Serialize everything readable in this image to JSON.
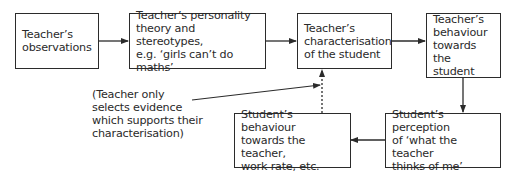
{
  "diagram": {
    "type": "flowchart",
    "nodes": [
      {
        "id": "n1",
        "label": "Teacher’s\nobservations"
      },
      {
        "id": "n2",
        "label": "Teacher’s personality\ntheory and stereotypes,\ne.g. ‘girls can’t do maths’"
      },
      {
        "id": "n3",
        "label": "Teacher’s\ncharacterisation\nof the student"
      },
      {
        "id": "n4",
        "label": "Teacher’s\nbehaviour\ntowards the\nstudent"
      },
      {
        "id": "n5",
        "label": "Student’s perception\nof ‘what the teacher\nthinks of me’"
      },
      {
        "id": "n6",
        "label": "Student’s behaviour\ntowards the teacher,\nwork rate, etc."
      }
    ],
    "annotation": {
      "label": "(Teacher only\n selects evidence\n which supports their\n characterisation)"
    },
    "edges": [
      {
        "from": "n1",
        "to": "n2",
        "style": "solid"
      },
      {
        "from": "n2",
        "to": "n3",
        "style": "solid"
      },
      {
        "from": "n3",
        "to": "n4",
        "style": "solid"
      },
      {
        "from": "n4",
        "to": "n5",
        "style": "solid"
      },
      {
        "from": "n5",
        "to": "n6",
        "style": "solid"
      },
      {
        "from": "n6",
        "to": "n3",
        "style": "dotted"
      },
      {
        "from": "annotation",
        "to": "n3-dotted-edge",
        "style": "solid"
      }
    ],
    "colors": {
      "line": "#2b2b2b",
      "text": "#2a2a2a",
      "background": "#ffffff"
    }
  }
}
